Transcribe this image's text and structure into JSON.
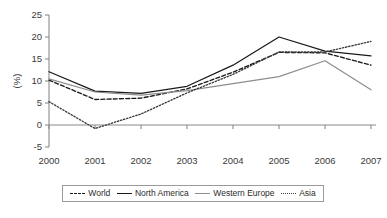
{
  "chart_data": {
    "type": "line",
    "title": "",
    "xlabel": "",
    "ylabel": "(%)",
    "categories": [
      "2000",
      "2001",
      "2002",
      "2003",
      "2004",
      "2005",
      "2006",
      "2007"
    ],
    "x": [
      2000,
      2001,
      2002,
      2003,
      2004,
      2005,
      2006,
      2007
    ],
    "ylim": [
      -5,
      25
    ],
    "yticks": [
      -5,
      0,
      5,
      10,
      15,
      20,
      25
    ],
    "ytick_labels": [
      "-5",
      "0",
      "5",
      "10",
      "15",
      "20",
      "25"
    ],
    "grid": false,
    "legend_position": "bottom",
    "series": [
      {
        "name": "World",
        "style": "dashed",
        "color": "#1a1a1a",
        "values": [
          10.2,
          5.8,
          6.1,
          8.2,
          12.0,
          16.5,
          16.4,
          13.6
        ]
      },
      {
        "name": "North America",
        "style": "solid",
        "color": "#1a1a1a",
        "values": [
          12.1,
          7.7,
          7.2,
          8.8,
          13.6,
          20.0,
          16.8,
          15.7
        ]
      },
      {
        "name": "Western Europe",
        "style": "solid",
        "color": "#8d8d8d",
        "values": [
          10.5,
          7.5,
          6.8,
          7.8,
          9.4,
          11.0,
          14.6,
          8.0
        ]
      },
      {
        "name": "Asia",
        "style": "dotted",
        "color": "#3c3c3c",
        "values": [
          5.3,
          -0.8,
          2.5,
          7.3,
          11.5,
          16.6,
          16.6,
          19.0
        ]
      }
    ]
  },
  "axis": {
    "y_title": "(%)"
  },
  "legend": {
    "items": [
      {
        "label": "World"
      },
      {
        "label": "North America"
      },
      {
        "label": "Western Europe"
      },
      {
        "label": "Asia"
      }
    ]
  }
}
